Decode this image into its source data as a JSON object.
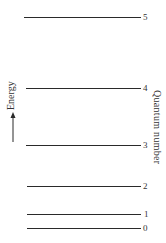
{
  "diagram": {
    "type": "energy-level-diagram",
    "y_axis_label": "Energy",
    "y_axis_arrow": "up",
    "right_axis_label": "Quantum number",
    "levels": [
      {
        "quantum_number": "5",
        "y": 17,
        "x_start": 24,
        "x_end": 141
      },
      {
        "quantum_number": "4",
        "y": 88,
        "x_start": 26,
        "x_end": 141
      },
      {
        "quantum_number": "3",
        "y": 145,
        "x_start": 26,
        "x_end": 141
      },
      {
        "quantum_number": "2",
        "y": 186,
        "x_start": 27,
        "x_end": 141
      },
      {
        "quantum_number": "1",
        "y": 214,
        "x_start": 27,
        "x_end": 141
      },
      {
        "quantum_number": "0",
        "y": 228,
        "x_start": 27,
        "x_end": 141
      }
    ],
    "colors": {
      "line": "#2a2a2a",
      "text": "#333333",
      "background": "#ffffff"
    }
  }
}
